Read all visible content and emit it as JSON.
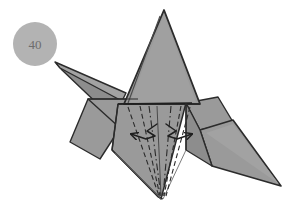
{
  "figure": {
    "type": "origami-instruction-diagram",
    "step_badge": {
      "label": "40",
      "shape": "circle",
      "fill_color": "#b3b3b3",
      "text_color": "#6d6d6d",
      "center": [
        35,
        44
      ],
      "radius": 22
    },
    "background_color": "#ffffff",
    "paper": {
      "front_color": "#9a9a9a",
      "shade_color": "#8d8d8d",
      "highlight_color": "#a6a6a6",
      "outline_color": "#2b2b2b",
      "crease_color": "#3a3a3a"
    },
    "model_description": "Folded paper model with tall central point, a narrow layered spike projecting up-left, a broad flap at lower-left, and a large wing at lower-right.",
    "annotations": {
      "fold_lines": [
        {
          "name": "valley-fold-left-outer",
          "style": "dashed"
        },
        {
          "name": "mountain-fold-left-inner",
          "style": "dash-dot"
        },
        {
          "name": "mountain-fold-center",
          "style": "dash-dot"
        },
        {
          "name": "mountain-fold-right-inner",
          "style": "dash-dot"
        },
        {
          "name": "valley-fold-right-outer",
          "style": "dashed"
        },
        {
          "name": "valley-fold-left-far",
          "style": "dashed"
        },
        {
          "name": "valley-fold-right-far",
          "style": "dashed"
        }
      ],
      "arrows": [
        {
          "name": "spread-arrow-left",
          "direction": "outward-left",
          "style": "open-head"
        },
        {
          "name": "spread-arrow-right",
          "direction": "outward-right",
          "style": "open-head"
        }
      ],
      "arrow_color": "#1f1f1f"
    }
  }
}
